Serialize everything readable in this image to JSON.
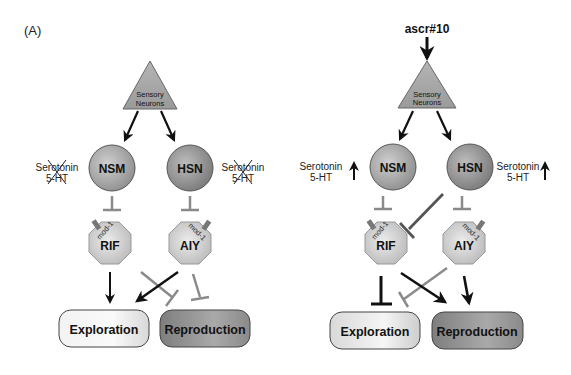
{
  "figure": {
    "panel_label": "(A)",
    "colors": {
      "black_edge": "#111111",
      "gray_inhibit": "#8a8a8a",
      "dark_inhibit": "#555555",
      "triangle_fill": "#a9a9a9",
      "circle_fill": "#a6a6a6",
      "octagon_fill": "#d2d2d2",
      "exploration_fill": "#ececec",
      "reproduction_fill": "#8d8d8d"
    },
    "left": {
      "sensory_line1": "Sensory",
      "sensory_line2": "Neurons",
      "nsm": "NSM",
      "hsn": "HSN",
      "serotonin_left_1": "Serotonin",
      "serotonin_left_2": "5-HT",
      "serotonin_right_1": "Serotonin",
      "serotonin_right_2": "5-HT",
      "rif": "RIF",
      "aiy": "AIY",
      "receptor_rif": "mod-1",
      "receptor_aiy": "mod-1",
      "exploration": "Exploration",
      "reproduction": "Reproduction"
    },
    "right": {
      "stimulus": "ascr#10",
      "sensory_line1": "Sensory",
      "sensory_line2": "Neurons",
      "nsm": "NSM",
      "hsn": "HSN",
      "serotonin_left_1": "Serotonin",
      "serotonin_left_2": "5-HT",
      "serotonin_right_1": "Serotonin",
      "serotonin_right_2": "5-HT",
      "rif": "RIF",
      "aiy": "AIY",
      "receptor_rif": "mod-1",
      "receptor_aiy": "mod-1",
      "exploration": "Exploration",
      "reproduction": "Reproduction"
    }
  }
}
